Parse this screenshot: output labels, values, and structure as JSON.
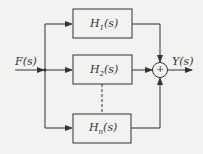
{
  "diagram": {
    "type": "parallel-system-block-diagram",
    "input": {
      "label": "F(s)"
    },
    "output": {
      "label": "Y(s)"
    },
    "blocks": [
      {
        "name": "H",
        "sub": "1",
        "arg": "(s)"
      },
      {
        "name": "H",
        "sub": "2",
        "arg": "(s)"
      },
      {
        "name": "H",
        "sub": "n",
        "arg": "(s)"
      }
    ],
    "summer": {
      "symbol": "+"
    },
    "colors": {
      "line": "#333333",
      "background": "#f2f2f0"
    }
  }
}
